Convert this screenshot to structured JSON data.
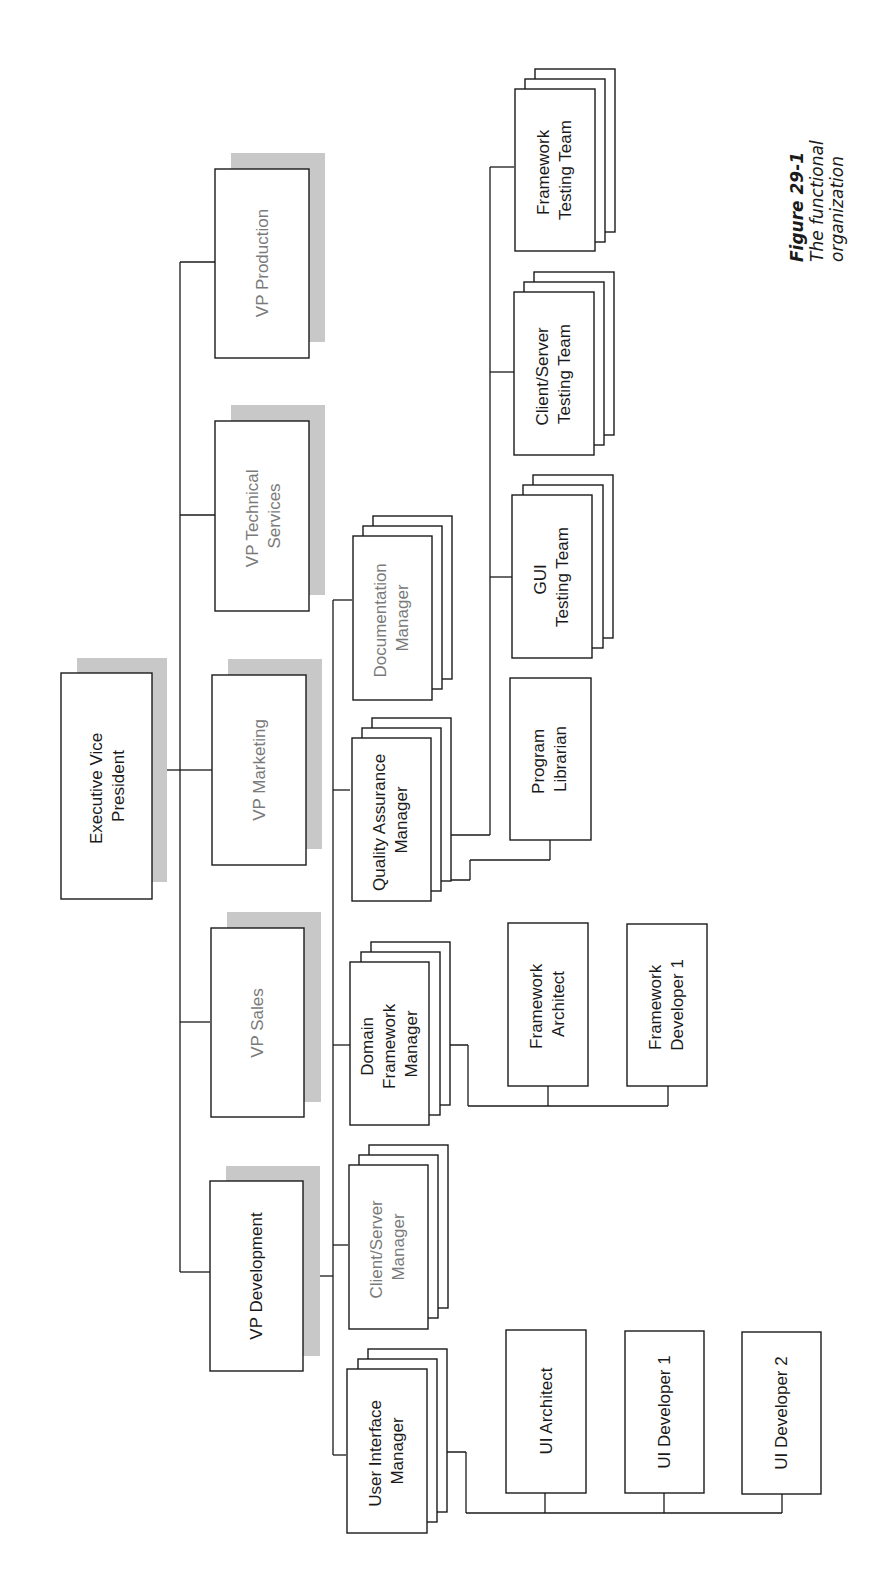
{
  "figure": {
    "number": "Figure 29-1",
    "caption_line1": "The functional",
    "caption_line2": "organization"
  },
  "org": {
    "root": {
      "line1": "Executive Vice",
      "line2": "President"
    },
    "vps": [
      {
        "line1": "VP Production",
        "line2": ""
      },
      {
        "line1": "VP Technical",
        "line2": "Services"
      },
      {
        "line1": "VP Marketing",
        "line2": ""
      },
      {
        "line1": "VP Sales",
        "line2": ""
      },
      {
        "line1": "VP Development",
        "line2": ""
      }
    ],
    "managers": [
      {
        "line1": "Documentation",
        "line2": "Manager",
        "line3": ""
      },
      {
        "line1": "Quality Assurance",
        "line2": "Manager",
        "line3": ""
      },
      {
        "line1": "Domain",
        "line2": "Framework",
        "line3": "Manager"
      },
      {
        "line1": "Client/Server",
        "line2": "Manager",
        "line3": ""
      },
      {
        "line1": "User Interface",
        "line2": "Manager",
        "line3": ""
      }
    ],
    "qa_reports": [
      {
        "line1": "Framework",
        "line2": "Testing Team"
      },
      {
        "line1": "Client/Server",
        "line2": "Testing Team"
      },
      {
        "line1": "GUI",
        "line2": "Testing Team"
      },
      {
        "line1": "Program",
        "line2": "Librarian"
      }
    ],
    "framework_reports": [
      {
        "line1": "Framework",
        "line2": "Architect"
      },
      {
        "line1": "Framework",
        "line2": "Developer 1"
      }
    ],
    "ui_reports": [
      {
        "line1": "UI Architect"
      },
      {
        "line1": "UI Developer 1"
      },
      {
        "line1": "UI Developer 2"
      }
    ]
  }
}
